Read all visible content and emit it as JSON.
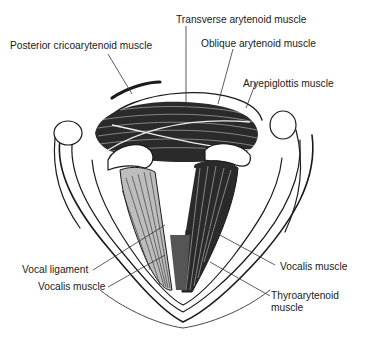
{
  "diagram": {
    "labels": {
      "posterior_cricoarytenoid": "Posterior cricoarytenoid muscle",
      "transverse_arytenoid": "Transverse arytenoid muscle",
      "oblique_arytenoid": "Oblique arytenoid muscle",
      "aryepiglottis": "Aryepiglottis muscle",
      "vocal_ligament": "Vocal ligament",
      "vocalis_left": "Vocalis muscle",
      "vocalis_right": "Vocalis muscle",
      "thyroarytenoid_line1": "Thyroarytenoid",
      "thyroarytenoid_line2": "muscle"
    },
    "colors": {
      "ink": "#1a1a1a",
      "background": "#ffffff",
      "muscle": "#2a2a2a"
    }
  }
}
